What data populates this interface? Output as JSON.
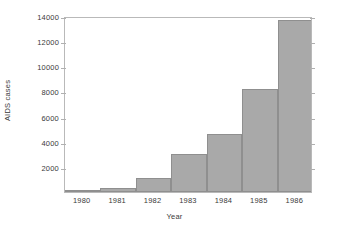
{
  "chart_data": {
    "type": "bar",
    "title": "",
    "subtitle": "",
    "xlabel": "Year",
    "ylabel": "AIDS cases",
    "categories": [
      "1980",
      "1981",
      "1982",
      "1983",
      "1984",
      "1985",
      "1986"
    ],
    "values": [
      50,
      300,
      1100,
      3000,
      4600,
      8200,
      13700
    ],
    "series": [
      {
        "name": "AIDS cases",
        "values": [
          50,
          300,
          1100,
          3000,
          4600,
          8200,
          13700
        ]
      }
    ],
    "ylim": [
      0,
      14000
    ],
    "xlim": [
      1979.5,
      1986.5
    ],
    "ytick_labels": [
      "2000",
      "4000",
      "6000",
      "8000",
      "10000",
      "12000",
      "14000"
    ],
    "ytick_values": [
      2000,
      4000,
      6000,
      8000,
      10000,
      12000,
      14000
    ],
    "xtick_labels": [
      "1980",
      "1981",
      "1982",
      "1983",
      "1984",
      "1985",
      "1986"
    ],
    "grid": false,
    "legend": false,
    "legend_position": "none",
    "bar_style": "histogram-adjacent",
    "colors": {
      "bar_fill": "#a9a9a9",
      "bar_border": "#8f8f8f",
      "axis": "#b9b9b9",
      "tick": "#b0b0b0",
      "text": "#3a3a3a",
      "background": "#ffffff"
    },
    "annotations": []
  }
}
